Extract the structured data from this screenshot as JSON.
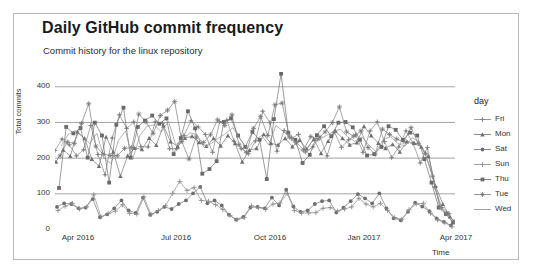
{
  "chart_data": {
    "type": "line",
    "title": "Daily GitHub commit frequency",
    "subtitle": "Commit history for the linux repository",
    "xlabel": "Time",
    "ylabel": "Total commits",
    "grid": true,
    "legend_position": "right",
    "legend_title": "day",
    "xlim": [
      "2016-03-20",
      "2017-04-10"
    ],
    "ylim": [
      0,
      440
    ],
    "yticks": [
      0,
      100,
      200,
      300,
      400
    ],
    "ytick_labels": [
      "0",
      "100",
      "200",
      "300",
      "400"
    ],
    "xticks": [
      "Apr 2016",
      "Jul 2016",
      "Oct 2016",
      "Jan 2017",
      "Apr 2017"
    ],
    "xtick_labels": [
      "Apr 2016",
      "Jul 2016",
      "Oct 2016",
      "Jan 2017",
      "Apr 2017"
    ],
    "annotations": [
      "Peak of about 435 commits near Oct 2016 on a Thursday",
      "All series fall toward 0 at the right edge in Apr 2017"
    ],
    "series": [
      {
        "name": "Fri",
        "marker": "plus-dot",
        "color": "#808080",
        "values": [
          220,
          252,
          236,
          205,
          222,
          290,
          209,
          152,
          255,
          320,
          282,
          300,
          231,
          230,
          300,
          296,
          225,
          225,
          262,
          303,
          286,
          265,
          215,
          300,
          305,
          246,
          225,
          211,
          247,
          330,
          298,
          218,
          276,
          254,
          265,
          216,
          230,
          258,
          205,
          272,
          229,
          250,
          264,
          215,
          275,
          300,
          245,
          200,
          230,
          275,
          240,
          185,
          228,
          118,
          60,
          43
        ]
      },
      {
        "name": "Mon",
        "marker": "triangle",
        "color": "#707070",
        "values": [
          188,
          222,
          204,
          272,
          254,
          196,
          176,
          258,
          216,
          148,
          205,
          227,
          223,
          255,
          235,
          290,
          245,
          231,
          255,
          260,
          243,
          232,
          254,
          233,
          262,
          240,
          188,
          221,
          226,
          265,
          240,
          236,
          254,
          231,
          249,
          225,
          252,
          212,
          246,
          275,
          254,
          236,
          242,
          288,
          262,
          241,
          226,
          237,
          216,
          245,
          241,
          230,
          204,
          120,
          70,
          35
        ]
      },
      {
        "name": "Sat",
        "marker": "filled-circle",
        "color": "#6e6e6e",
        "values": [
          62,
          72,
          70,
          58,
          60,
          84,
          33,
          41,
          58,
          80,
          52,
          45,
          88,
          40,
          48,
          62,
          56,
          70,
          80,
          100,
          118,
          72,
          80,
          66,
          40,
          26,
          34,
          60,
          62,
          58,
          88,
          66,
          110,
          63,
          48,
          52,
          70,
          78,
          80,
          46,
          60,
          78,
          98,
          86,
          72,
          100,
          58,
          30,
          24,
          48,
          74,
          63,
          50,
          30,
          20,
          10
        ]
      },
      {
        "name": "Sun",
        "marker": "plus",
        "color": "#8a8a8a",
        "values": [
          52,
          64,
          72,
          56,
          62,
          96,
          34,
          43,
          50,
          68,
          44,
          42,
          90,
          40,
          52,
          65,
          100,
          133,
          108,
          116,
          80,
          78,
          68,
          55,
          38,
          26,
          32,
          65,
          60,
          55,
          70,
          73,
          100,
          52,
          45,
          45,
          46,
          58,
          60,
          50,
          56,
          62,
          86,
          70,
          62,
          72,
          52,
          32,
          27,
          54,
          70,
          72,
          44,
          25,
          18,
          6
        ]
      },
      {
        "name": "Thu",
        "marker": "filled-square",
        "color": "#6a6a6a",
        "values": [
          115,
          286,
          268,
          283,
          200,
          298,
          262,
          130,
          292,
          340,
          200,
          286,
          304,
          318,
          295,
          310,
          210,
          255,
          330,
          282,
          155,
          168,
          190,
          300,
          310,
          262,
          230,
          272,
          250,
          140,
          308,
          435,
          270,
          250,
          185,
          208,
          263,
          288,
          260,
          298,
          300,
          285,
          250,
          206,
          210,
          230,
          288,
          278,
          250,
          270,
          262,
          196,
          130,
          60,
          42,
          18
        ]
      },
      {
        "name": "Tue",
        "marker": "star-plus",
        "color": "#777777",
        "values": [
          205,
          244,
          240,
          296,
          351,
          232,
          210,
          206,
          205,
          226,
          228,
          322,
          300,
          268,
          318,
          333,
          357,
          245,
          196,
          258,
          242,
          264,
          306,
          290,
          320,
          236,
          215,
          282,
          315,
          262,
          348,
          353,
          258,
          242,
          222,
          259,
          252,
          272,
          298,
          342,
          272,
          260,
          275,
          228,
          210,
          280,
          265,
          252,
          245,
          284,
          240,
          212,
          148,
          62,
          44,
          22
        ]
      },
      {
        "name": "Wed",
        "marker": "line",
        "color": "#8c8c8c",
        "values": [
          232,
          265,
          276,
          258,
          240,
          268,
          198,
          183,
          248,
          275,
          195,
          262,
          288,
          292,
          272,
          302,
          236,
          250,
          270,
          264,
          228,
          240,
          255,
          268,
          284,
          252,
          226,
          248,
          262,
          236,
          290,
          274,
          255,
          230,
          212,
          245,
          250,
          262,
          272,
          280,
          258,
          246,
          258,
          235,
          216,
          252,
          258,
          240,
          232,
          256,
          244,
          200,
          140,
          58,
          38,
          15
        ]
      }
    ]
  }
}
